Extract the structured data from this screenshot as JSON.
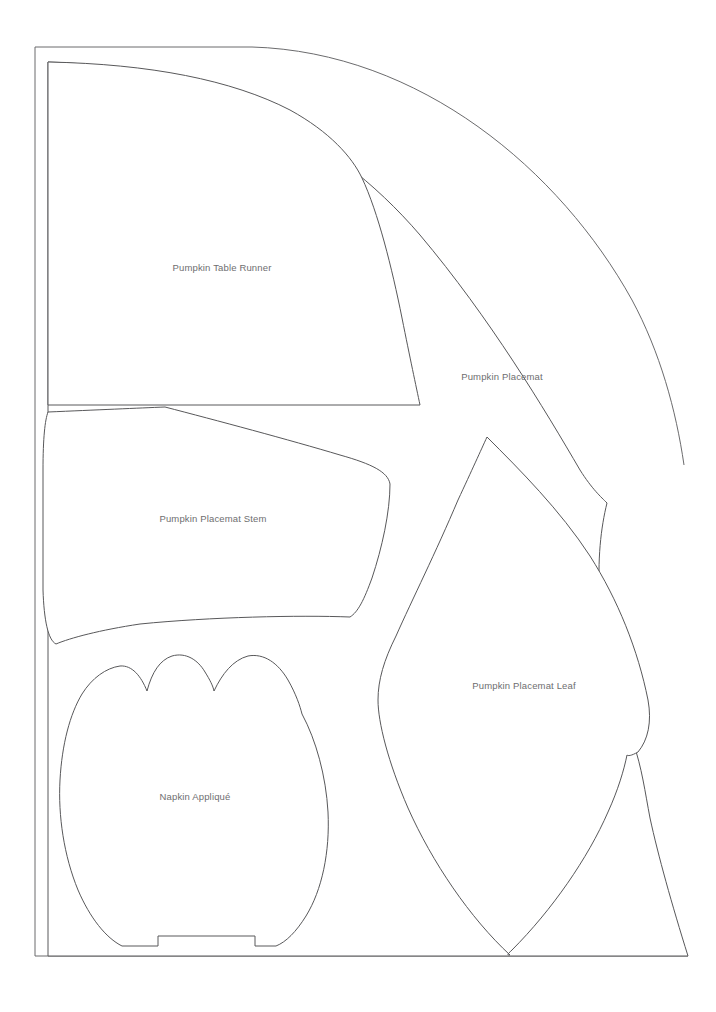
{
  "document": {
    "kind": "sewing-pattern-sheet",
    "page_width": 716,
    "page_height": 1012,
    "background_color": "#ffffff",
    "line_color": "#58585a",
    "label_color": "#6e6e70"
  },
  "pieces": [
    {
      "id": "pumpkin-table-runner",
      "label": "Pumpkin Table Runner",
      "label_x": 222,
      "label_y": 268
    },
    {
      "id": "pumpkin-placemat",
      "label": "Pumpkin Placemat",
      "label_x": 502,
      "label_y": 377
    },
    {
      "id": "pumpkin-placemat-stem",
      "label": "Pumpkin Placemat Stem",
      "label_x": 213,
      "label_y": 519
    },
    {
      "id": "pumpkin-placemat-leaf",
      "label": "Pumpkin Placemat Leaf",
      "label_x": 524,
      "label_y": 686
    },
    {
      "id": "napkin-applique",
      "label": "Napkin Appliqué",
      "label_x": 195,
      "label_y": 797
    }
  ],
  "page_frame": {
    "left": 35,
    "top": 47,
    "bottom": 956,
    "right_cut": 688
  }
}
